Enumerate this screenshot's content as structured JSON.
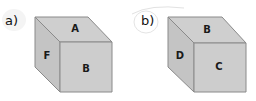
{
  "figures": [
    {
      "label": "a)",
      "cube": {
        "top_face": "A",
        "left_face": "F",
        "front_face": "B"
      }
    },
    {
      "label": "b)",
      "cube": {
        "top_face": "B",
        "left_face": "D",
        "front_face": "C"
      }
    }
  ],
  "colors": {
    "top_face": "#cfcfcf",
    "left_face": "#c4c4c4",
    "front_face": "#cdcdcd",
    "edge": "#8a8a8a"
  }
}
